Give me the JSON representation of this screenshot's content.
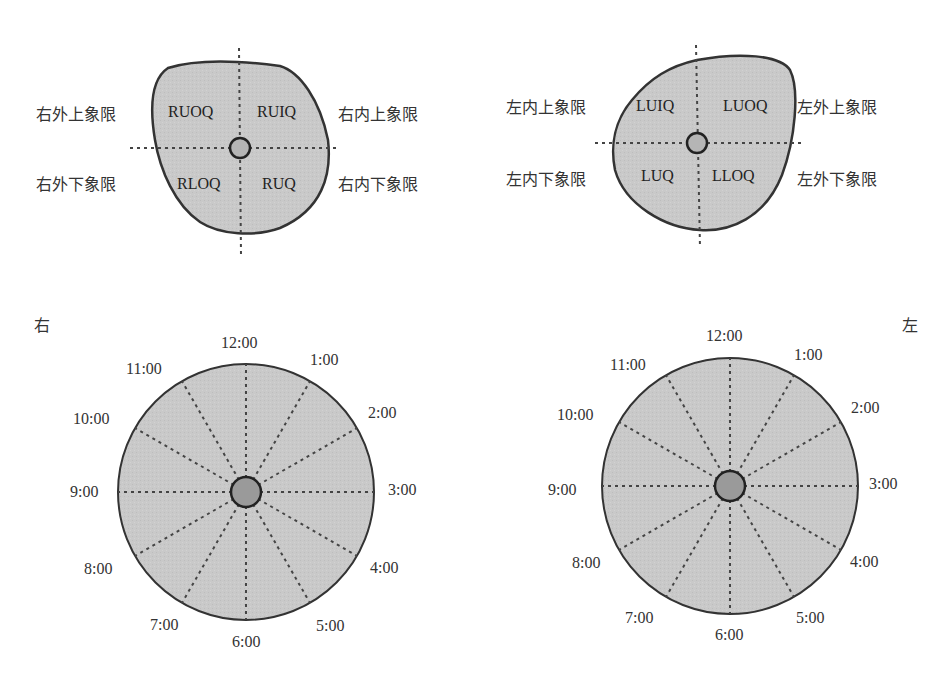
{
  "right_breast_quadrants": {
    "labels": {
      "upper_outer": "右外上象限",
      "upper_inner": "右内上象限",
      "lower_outer": "右外下象限",
      "lower_inner": "右内下象限"
    },
    "codes": {
      "upper_outer": "RUOQ",
      "upper_inner": "RUIQ",
      "lower_outer": "RLOQ",
      "lower_inner": "RUQ"
    }
  },
  "left_breast_quadrants": {
    "labels": {
      "upper_inner": "左内上象限",
      "upper_outer": "左外上象限",
      "lower_inner": "左内下象限",
      "lower_outer": "左外下象限"
    },
    "codes": {
      "upper_inner": "LUIQ",
      "upper_outer": "LUOQ",
      "lower_inner": "LUQ",
      "lower_outer": "LLOQ"
    }
  },
  "right_clock": {
    "side_label": "右",
    "hours": [
      "12:00",
      "1:00",
      "2:00",
      "3:00",
      "4:00",
      "5:00",
      "6:00",
      "7:00",
      "8:00",
      "9:00",
      "10:00",
      "11:00"
    ]
  },
  "left_clock": {
    "side_label": "左",
    "hours": [
      "12:00",
      "1:00",
      "2:00",
      "3:00",
      "4:00",
      "5:00",
      "6:00",
      "7:00",
      "8:00",
      "9:00",
      "10:00",
      "11:00"
    ]
  },
  "colors": {
    "fill": "#c8c8c8",
    "outline": "#333333",
    "dash": "#444444"
  }
}
